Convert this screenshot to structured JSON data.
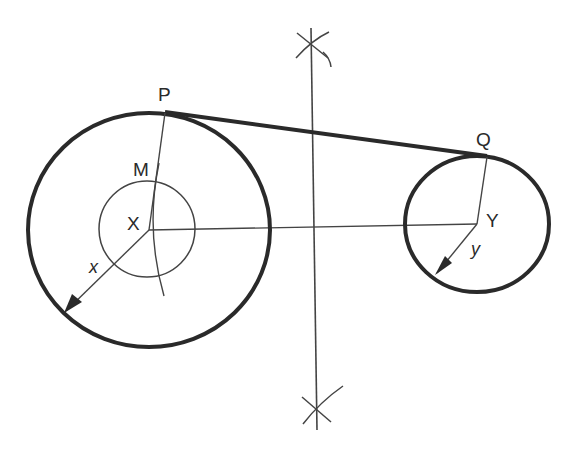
{
  "diagram": {
    "colors": {
      "ink": "#2a2a2a",
      "background": "#ffffff"
    },
    "labels": {
      "P": "P",
      "Q": "Q",
      "M": "M",
      "X": "X",
      "Y": "Y",
      "x": "x",
      "y": "y"
    },
    "elements": {
      "large_circle": {
        "center": "X",
        "cx": 149,
        "cy": 230,
        "rx": 121,
        "ry": 117,
        "radius_label": "x"
      },
      "inner_circle": {
        "center": "X",
        "cx": 149,
        "cy": 230,
        "r": 48
      },
      "small_circle": {
        "center": "Y",
        "cx": 477,
        "cy": 224,
        "rx": 72,
        "ry": 68,
        "radius_label": "y"
      },
      "tangent_points": [
        "P",
        "Q"
      ],
      "centre_line": "X to Y",
      "perpendicular_bisector": "vertical line with construction arcs above and below"
    }
  }
}
